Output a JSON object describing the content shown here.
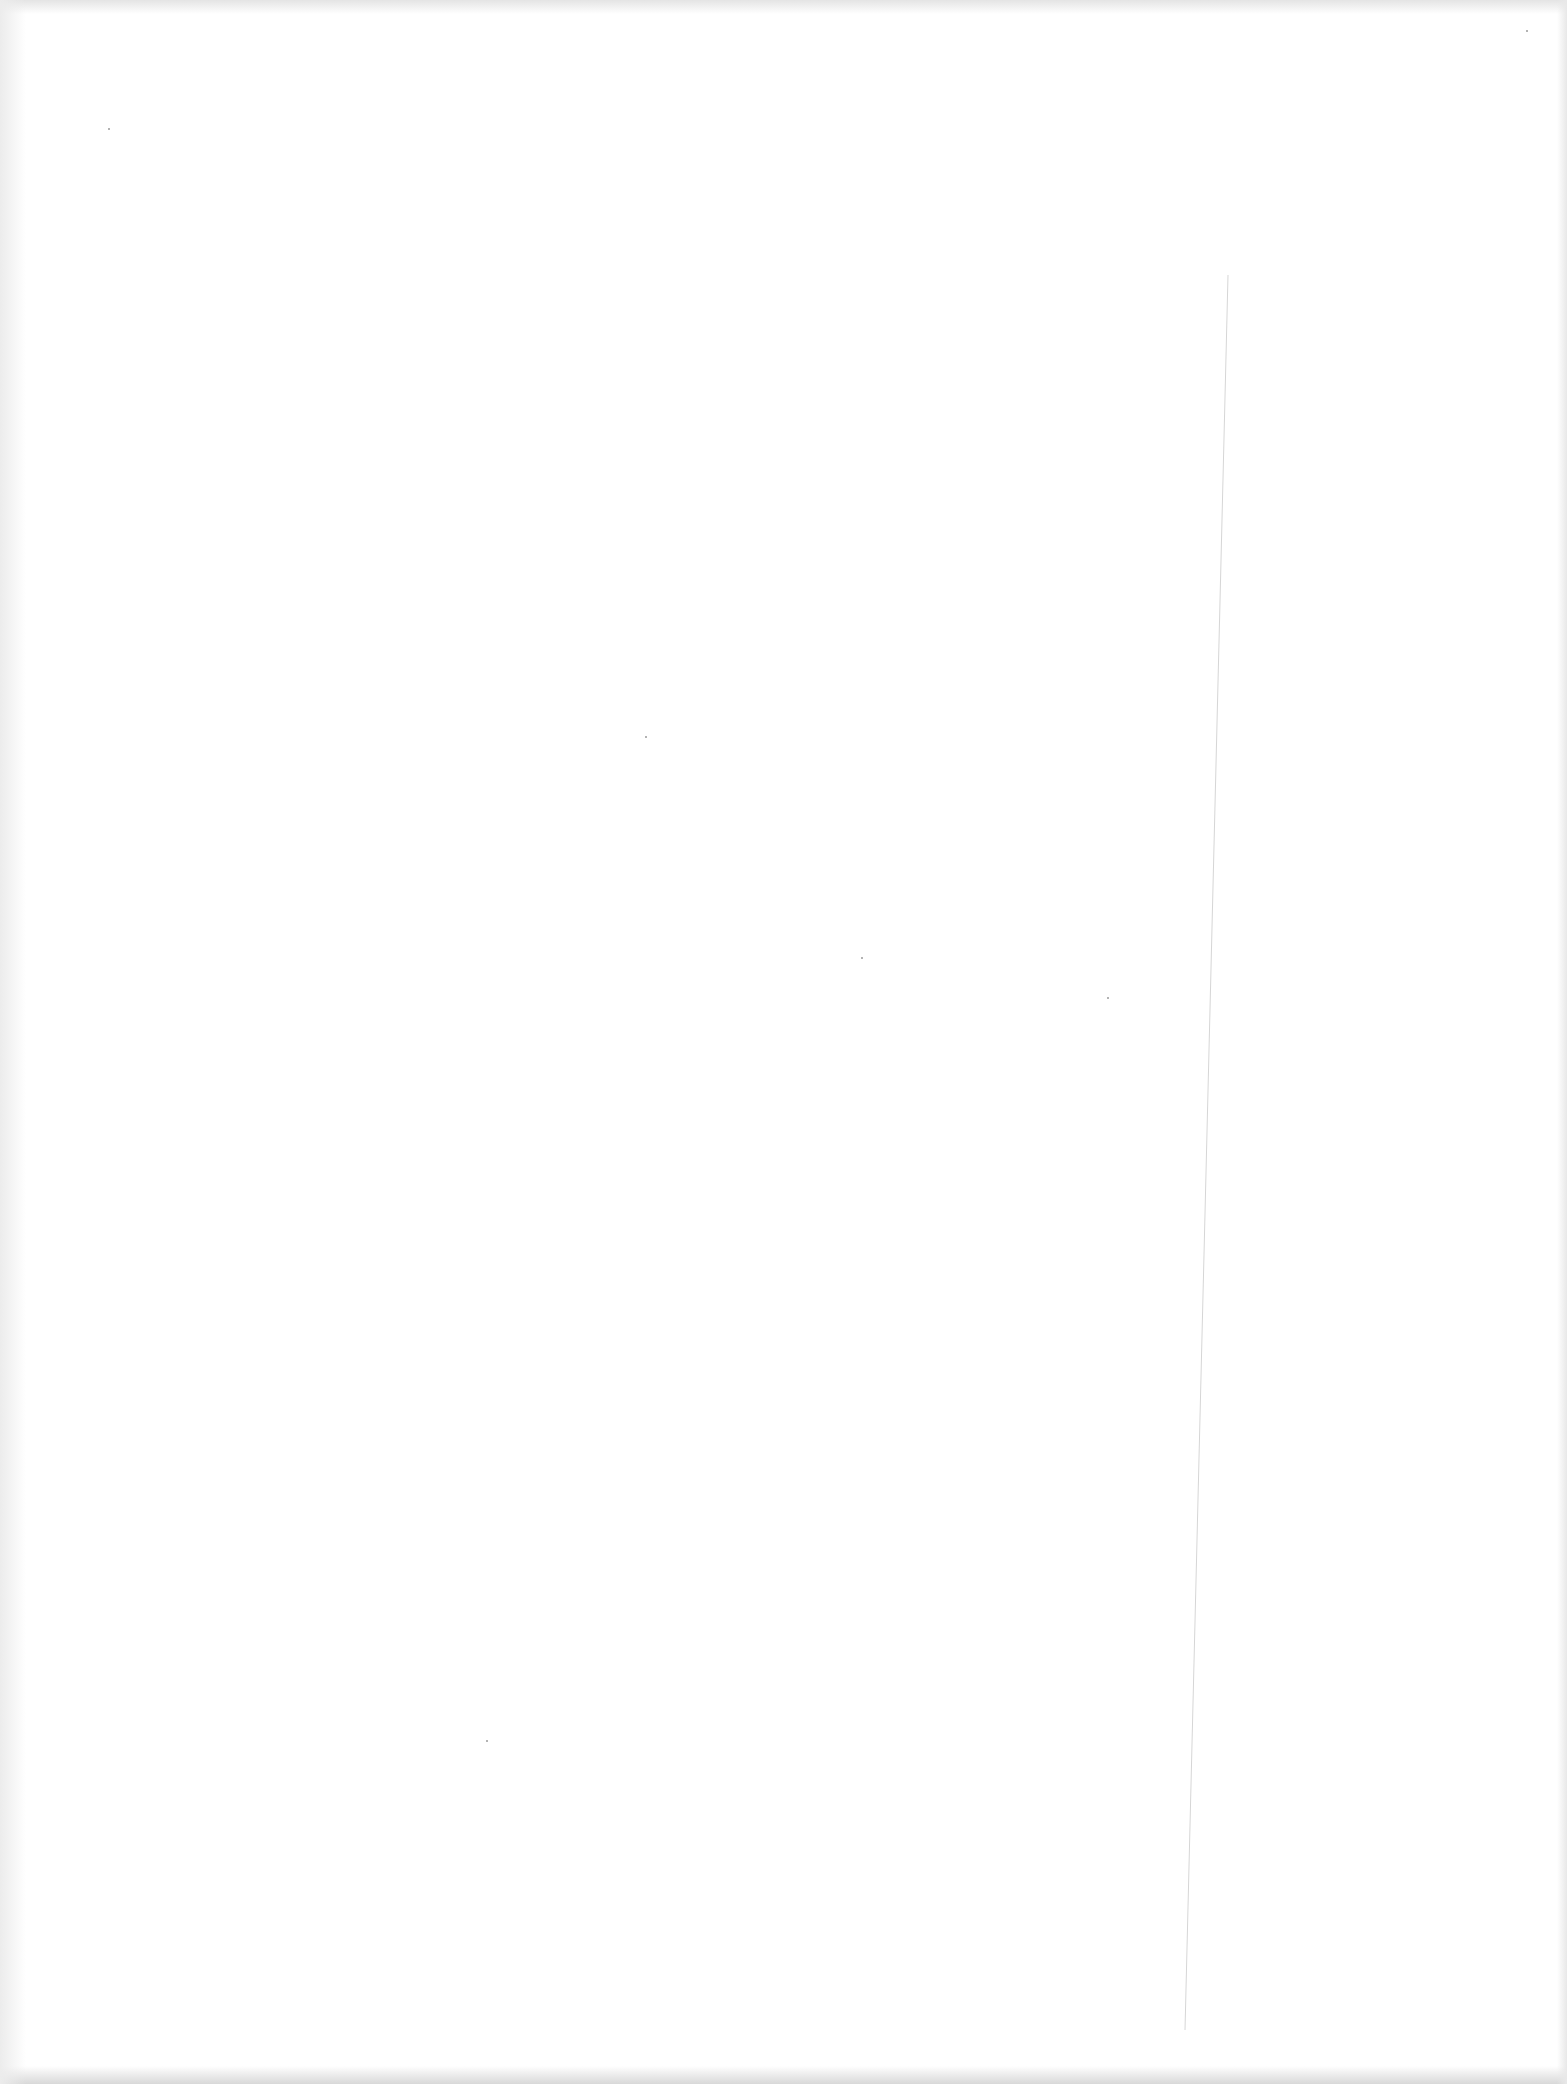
{
  "page": {
    "type": "blank scanned page",
    "text_content": [],
    "background_color": "#ffffff"
  }
}
